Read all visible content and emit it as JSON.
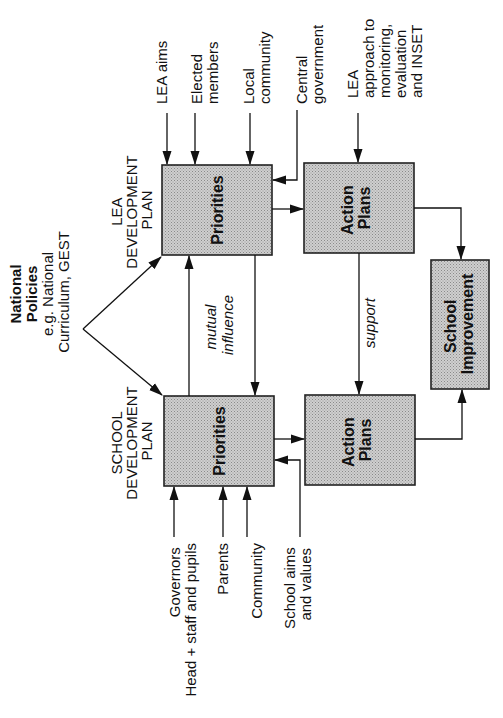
{
  "diagram": {
    "orientation": "rotated-90-ccw",
    "colors": {
      "box_fill": "#bdbdbd",
      "line": "#111111",
      "background": "#ffffff"
    },
    "national_policies": {
      "title_lines": [
        "National",
        "Policies"
      ],
      "subtitle_lines": [
        "e.g. National",
        "Curriculum, GEST"
      ]
    },
    "lea": {
      "plan_label_lines": [
        "LEA",
        "DEVELOPMENT",
        "PLAN"
      ],
      "priorities_label": "Priorities",
      "action_plans_lines": [
        "Action",
        "Plans"
      ],
      "inputs": [
        {
          "lines": [
            "LEA aims"
          ]
        },
        {
          "lines": [
            "Elected",
            "members"
          ]
        },
        {
          "lines": [
            "Local",
            "community"
          ]
        },
        {
          "lines": [
            "Central",
            "government"
          ]
        },
        {
          "lines": [
            "LEA",
            "approach to",
            "monitoring,",
            "evaluation",
            "and INSET"
          ]
        }
      ]
    },
    "school": {
      "plan_label_lines": [
        "SCHOOL",
        "DEVELOPMENT",
        "PLAN"
      ],
      "priorities_label": "Priorities",
      "action_plans_lines": [
        "Action",
        "Plans"
      ],
      "inputs": [
        {
          "lines": [
            "Governors",
            "Head + staff and pupils"
          ]
        },
        {
          "lines": [
            "Parents"
          ]
        },
        {
          "lines": [
            "Community"
          ]
        },
        {
          "lines": [
            "School aims",
            "and values"
          ]
        }
      ]
    },
    "links": {
      "mutual_influence_lines": [
        "mutual",
        "influence"
      ],
      "support": "support"
    },
    "outcome": {
      "lines": [
        "School",
        "Improvement"
      ]
    }
  }
}
